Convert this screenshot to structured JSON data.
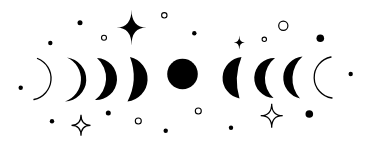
{
  "illustration": {
    "background_color": "#ffffff",
    "ink_color": "#000000",
    "canvas": {
      "width": 371,
      "height": 144
    },
    "moons": [
      {
        "name": "moon-1-thin-crescent-outline",
        "kind": "arc",
        "x1": 37.5,
        "y1": 58.5,
        "x2": 34,
        "y2": 99.5,
        "r": 21.5,
        "sweep": 1,
        "stroke_width": 1.3
      },
      {
        "name": "moon-2-crescent",
        "kind": "crescent",
        "bulge": "right",
        "x1": 67,
        "y1": 57.5,
        "x2": 65,
        "y2": 101.5,
        "r_outer": 22.1,
        "r_inner": 23.7
      },
      {
        "name": "moon-3-crescent",
        "kind": "crescent",
        "bulge": "right",
        "x1": 97,
        "y1": 58,
        "x2": 95,
        "y2": 100,
        "r_outer": 21,
        "r_inner": 27
      },
      {
        "name": "moon-4-thick-crescent",
        "kind": "crescent",
        "bulge": "right",
        "x1": 130,
        "y1": 57,
        "x2": 127.5,
        "y2": 101.5,
        "r_outer": 22.6,
        "r_inner": 54.7
      },
      {
        "name": "moon-5-full-moon",
        "kind": "full",
        "cx": 182.5,
        "cy": 74,
        "r": 15.3
      },
      {
        "name": "moon-6-thick-crescent",
        "kind": "crescent",
        "bulge": "left",
        "x1": 241.5,
        "y1": 57,
        "x2": 239.5,
        "y2": 98.5,
        "r_outer": 21,
        "r_inner": 63
      },
      {
        "name": "moon-7-crescent",
        "kind": "crescent",
        "bulge": "left",
        "x1": 275,
        "y1": 58,
        "x2": 273.5,
        "y2": 98,
        "r_outer": 20,
        "r_inner": 26.2
      },
      {
        "name": "moon-8-crescent",
        "kind": "crescent",
        "bulge": "left",
        "x1": 302.5,
        "y1": 56.5,
        "x2": 300,
        "y2": 98.5,
        "r_outer": 21.3,
        "r_inner": 29.6
      },
      {
        "name": "moon-9-thin-crescent-outline",
        "kind": "arc",
        "x1": 331,
        "y1": 57,
        "x2": 332,
        "y2": 98,
        "r": 20.8,
        "sweep": 0,
        "stroke_width": 1.3
      }
    ],
    "decorations": [
      {
        "name": "dot-top-left-low",
        "kind": "dot",
        "cx": 50.3,
        "cy": 43,
        "r": 2.2
      },
      {
        "name": "dot-top-left-high",
        "kind": "dot",
        "cx": 80,
        "cy": 22.7,
        "r": 2.5
      },
      {
        "name": "ring-top-left",
        "kind": "ring",
        "cx": 104,
        "cy": 37.7,
        "r": 2.5,
        "stroke_width": 1.1
      },
      {
        "name": "sparkle-large-top",
        "kind": "sparkle",
        "filled": true,
        "cx": 131.5,
        "cy": 27.5,
        "hw": 15,
        "hh": 18
      },
      {
        "name": "ring-top-center",
        "kind": "ring",
        "cx": 164.3,
        "cy": 15.3,
        "r": 2.7,
        "stroke_width": 1.1
      },
      {
        "name": "dot-top-center",
        "kind": "dot",
        "cx": 194.3,
        "cy": 33.3,
        "r": 2.2
      },
      {
        "name": "sparkle-small-top-right",
        "kind": "sparkle",
        "filled": true,
        "cx": 239.3,
        "cy": 42.5,
        "hw": 5.5,
        "hh": 7
      },
      {
        "name": "ring-top-right-small",
        "kind": "ring",
        "cx": 264.3,
        "cy": 39.3,
        "r": 2.2,
        "stroke_width": 1.1
      },
      {
        "name": "ring-top-right-large",
        "kind": "ring",
        "cx": 283.3,
        "cy": 25.7,
        "r": 4.6,
        "stroke_width": 1.2
      },
      {
        "name": "dot-top-right-large",
        "kind": "dot",
        "cx": 320.3,
        "cy": 38.3,
        "r": 3.8
      },
      {
        "name": "dot-middle-left",
        "kind": "dot",
        "cx": 20.7,
        "cy": 87.7,
        "r": 2.2
      },
      {
        "name": "dot-middle-right",
        "kind": "dot",
        "cx": 350.7,
        "cy": 74,
        "r": 2.2
      },
      {
        "name": "dot-bottom-left",
        "kind": "dot",
        "cx": 52,
        "cy": 121.3,
        "r": 2.2
      },
      {
        "name": "sparkle-outline-bottom-left",
        "kind": "sparkle",
        "filled": false,
        "cx": 81,
        "cy": 125.3,
        "hw": 9.5,
        "hh": 10.5,
        "stroke_width": 1.2
      },
      {
        "name": "dot-bottom-left-high",
        "kind": "dot",
        "cx": 108.3,
        "cy": 113,
        "r": 2.5
      },
      {
        "name": "ring-bottom-left",
        "kind": "ring",
        "cx": 138.3,
        "cy": 121,
        "r": 3,
        "stroke_width": 1.1
      },
      {
        "name": "dot-bottom-center",
        "kind": "dot",
        "cx": 165.7,
        "cy": 130.7,
        "r": 2.2
      },
      {
        "name": "ring-bottom-center",
        "kind": "ring",
        "cx": 198.3,
        "cy": 111,
        "r": 3,
        "stroke_width": 1.1
      },
      {
        "name": "dot-bottom-center-right",
        "kind": "dot",
        "cx": 231,
        "cy": 127.7,
        "r": 2.2
      },
      {
        "name": "sparkle-outline-bottom-right",
        "kind": "sparkle",
        "filled": false,
        "cx": 271.7,
        "cy": 115.7,
        "hw": 11,
        "hh": 12,
        "stroke_width": 1.2
      },
      {
        "name": "dot-bottom-right-large",
        "kind": "dot",
        "cx": 309.3,
        "cy": 114,
        "r": 3.8
      }
    ]
  }
}
